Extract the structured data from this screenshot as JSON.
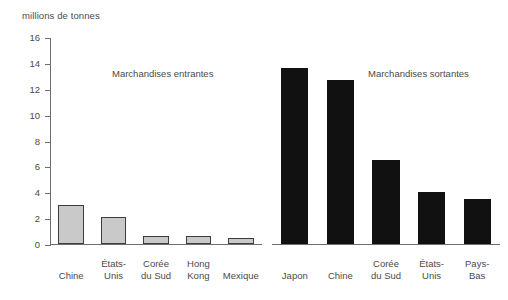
{
  "chart_data": {
    "type": "bar",
    "title": "millions de tonnes",
    "ylabel": "millions de tonnes",
    "xlabel": "",
    "ylim": [
      0,
      16
    ],
    "ytick_step": 2,
    "yticks": [
      "0",
      "2",
      "4",
      "6",
      "8",
      "10",
      "12",
      "14",
      "16"
    ],
    "grid": false,
    "legend": "none",
    "panels": [
      {
        "name": "incoming",
        "heading": "Marchandises entrantes",
        "bar_style": "gray-fill-black-outline",
        "categories": [
          "Chine",
          "États-\nUnis",
          "Corée\ndu Sud",
          "Hong\nKong",
          "Mexique"
        ],
        "values": [
          3.0,
          2.1,
          0.6,
          0.6,
          0.45
        ]
      },
      {
        "name": "outgoing",
        "heading": "Marchandises sortantes",
        "bar_style": "solid-black",
        "categories": [
          "Japon",
          "Chine",
          "Corée\ndu Sud",
          "États-\nUnis",
          "Pays-\nBas"
        ],
        "values": [
          13.6,
          12.7,
          6.5,
          4.0,
          3.5
        ]
      }
    ],
    "colors": {
      "bar_gray_fill": "#c9c9c9",
      "bar_outline": "#3d3d3d",
      "bar_black_fill": "#111111",
      "axis": "#6e6e6e",
      "text": "#4a4a4a",
      "background": "#ffffff"
    }
  }
}
